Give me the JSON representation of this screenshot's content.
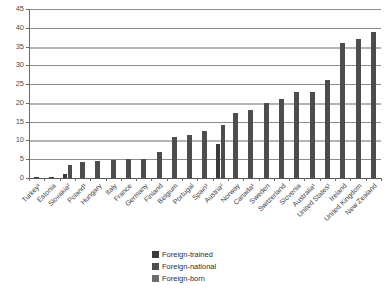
{
  "chart_data": {
    "type": "bar",
    "title": "",
    "subtitle": "",
    "xlabel": "",
    "ylabel": "",
    "ylim": [
      0,
      45
    ],
    "yticks": [
      0,
      5,
      10,
      15,
      20,
      25,
      30,
      35,
      40,
      45
    ],
    "ytick_labels": [
      "0",
      "5",
      "10",
      "15",
      "20",
      "25",
      "30",
      "35",
      "40",
      "45"
    ],
    "grid": true,
    "legend_position": "bottom-center",
    "categories": [
      "Turkey¹",
      "Estonia",
      "Slovakia²",
      "Poland¹",
      "Hungary",
      "Italy",
      "France",
      "Germany",
      "Finland",
      "Belgium",
      "Portugal",
      "Spain¹",
      "Austria²",
      "Norway",
      "Canada¹",
      "Sweden",
      "Switzerland",
      "Slovenia",
      "Australia¹",
      "United States¹",
      "Ireland",
      "United Kingdom",
      "New Zealand"
    ],
    "series": [
      {
        "name": "Foreign-trained",
        "color": "#3a3a3a",
        "values": [
          0.2,
          0.4,
          1.0,
          null,
          null,
          null,
          null,
          null,
          null,
          null,
          null,
          null,
          9.0,
          null,
          null,
          null,
          null,
          null,
          null,
          null,
          null,
          null,
          null
        ]
      },
      {
        "name": "Foreign-national",
        "color": "#4d4d4d",
        "values": [
          null,
          null,
          3.4,
          4.2,
          4.6,
          4.9,
          5.0,
          5.1,
          7.0,
          11.0,
          11.4,
          12.4,
          14.0,
          17.2,
          18.2,
          20.0,
          21.0,
          23.0,
          23.0,
          26.0,
          36.0,
          37.0,
          39.0
        ]
      },
      {
        "name": "Foreign-born",
        "color": "#6e6e6e",
        "values": [
          null,
          null,
          null,
          null,
          null,
          null,
          null,
          null,
          null,
          null,
          null,
          null,
          null,
          null,
          null,
          null,
          null,
          null,
          null,
          null,
          null,
          null,
          null
        ]
      }
    ]
  },
  "legend": {
    "items": [
      {
        "label": "Foreign-trained",
        "swatch": "legend-swatch-dark"
      },
      {
        "label": "Foreign-national",
        "swatch": "legend-swatch-medium"
      },
      {
        "label": "Foreign-born",
        "swatch": "legend-swatch-light"
      }
    ]
  }
}
